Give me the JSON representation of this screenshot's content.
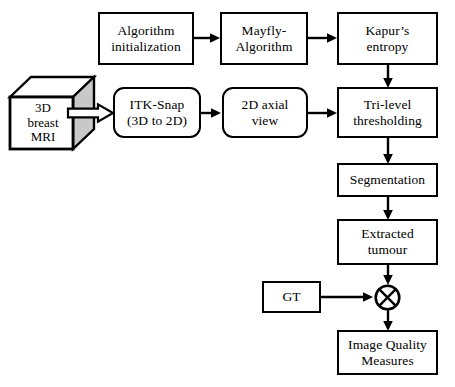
{
  "figure": {
    "background_color": "#ffffff",
    "line_color": "#000000",
    "cube_side_fill": "#c8c8c8",
    "cube_top_fill": "#ffffff",
    "cube_front_fill": "#ffffff"
  },
  "nodes": {
    "algorithm_initialization": {
      "label": "Algorithm\ninitialization",
      "shape": "rectangle"
    },
    "mayfly_algorithm": {
      "label": "Mayfly-\nAlgorithm",
      "shape": "rectangle"
    },
    "kapurs_entropy": {
      "label": "Kapur’s\nentropy",
      "shape": "rectangle"
    },
    "mri_source": {
      "label": "3D\nbreast\nMRI",
      "shape": "cube-3d"
    },
    "itk_snap": {
      "label": "ITK-Snap\n(3D to 2D)",
      "shape": "rounded-rectangle"
    },
    "axial_view": {
      "label": "2D axial\nview",
      "shape": "rounded-rectangle"
    },
    "tri_level_thresholding": {
      "label": "Tri-level\nthresholding",
      "shape": "rectangle"
    },
    "segmentation": {
      "label": "Segmentation",
      "shape": "rectangle"
    },
    "extracted_tumour": {
      "label": "Extracted\ntumour",
      "shape": "rectangle"
    },
    "ground_truth": {
      "label": "GT",
      "shape": "rectangle"
    },
    "comparison_operator": {
      "label": "⊗",
      "shape": "circle-cross"
    },
    "image_quality_measures": {
      "label": "Image Quality\nMeasures",
      "shape": "rectangle"
    }
  },
  "edges": [
    {
      "from": "algorithm_initialization",
      "to": "mayfly_algorithm",
      "style": "solid-arrow"
    },
    {
      "from": "mayfly_algorithm",
      "to": "kapurs_entropy",
      "style": "solid-arrow"
    },
    {
      "from": "kapurs_entropy",
      "to": "tri_level_thresholding",
      "style": "solid-arrow"
    },
    {
      "from": "mri_source",
      "to": "itk_snap",
      "style": "block-arrow"
    },
    {
      "from": "itk_snap",
      "to": "axial_view",
      "style": "solid-arrow"
    },
    {
      "from": "axial_view",
      "to": "tri_level_thresholding",
      "style": "solid-arrow"
    },
    {
      "from": "tri_level_thresholding",
      "to": "segmentation",
      "style": "solid-arrow"
    },
    {
      "from": "segmentation",
      "to": "extracted_tumour",
      "style": "solid-arrow"
    },
    {
      "from": "extracted_tumour",
      "to": "comparison_operator",
      "style": "solid-arrow"
    },
    {
      "from": "ground_truth",
      "to": "comparison_operator",
      "style": "solid-arrow"
    },
    {
      "from": "comparison_operator",
      "to": "image_quality_measures",
      "style": "solid-arrow"
    }
  ]
}
